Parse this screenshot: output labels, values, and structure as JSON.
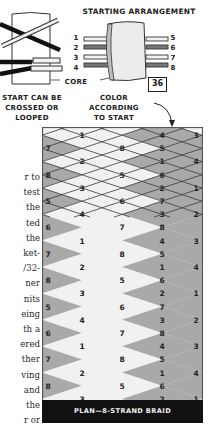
{
  "illustration": {
    "title": "STARTING ARRANGEMENT",
    "figure_number": "36",
    "strand_labels_left": [
      "1",
      "2",
      "3",
      "4"
    ],
    "strand_labels_right": [
      "5",
      "6",
      "7",
      "8"
    ],
    "core_label": "CORE",
    "left_caption": [
      "START CAN BE",
      "CROSSED OR",
      "LOOPED"
    ],
    "right_caption": [
      "COLOR",
      "ACCORDING",
      "TO START"
    ]
  },
  "body_text_fragments": [
    "r to",
    "test",
    "the",
    "ted",
    "the",
    "ket-",
    "/32-",
    "ner",
    "nits",
    "eing",
    "th a",
    "ered",
    "ther",
    "ving",
    "and",
    "the",
    "r or"
  ],
  "braid_plan": {
    "label": "PLAN—8-STRAND BRAID",
    "colors": {
      "light": "#f1f1f1",
      "dark": "#a9a9a9",
      "line": "#3a3a3a",
      "frame": "#555555"
    },
    "rows": [
      {
        "left": "",
        "a": "1",
        "b": "4",
        "right": "3"
      },
      {
        "left": "7",
        "a": "8",
        "b": "5",
        "right": ""
      },
      {
        "left": "",
        "a": "2",
        "b": "1",
        "right": "4"
      },
      {
        "left": "8",
        "a": "5",
        "b": "6",
        "right": ""
      },
      {
        "left": "",
        "a": "3",
        "b": "2",
        "right": "1"
      },
      {
        "left": "5",
        "a": "6",
        "b": "7",
        "right": ""
      },
      {
        "left": "",
        "a": "4",
        "b": "3",
        "right": "2"
      },
      {
        "left": "6",
        "a": "7",
        "b": "8",
        "right": ""
      },
      {
        "left": "",
        "a": "1",
        "b": "4",
        "right": "3"
      },
      {
        "left": "7",
        "a": "8",
        "b": "5",
        "right": ""
      },
      {
        "left": "",
        "a": "2",
        "b": "1",
        "right": "4"
      },
      {
        "left": "8",
        "a": "5",
        "b": "6",
        "right": ""
      },
      {
        "left": "",
        "a": "3",
        "b": "2",
        "right": "1"
      },
      {
        "left": "5",
        "a": "6",
        "b": "7",
        "right": ""
      },
      {
        "left": "",
        "a": "4",
        "b": "3",
        "right": "2"
      },
      {
        "left": "6",
        "a": "7",
        "b": "8",
        "right": ""
      },
      {
        "left": "",
        "a": "1",
        "b": "4",
        "right": "3"
      },
      {
        "left": "7",
        "a": "8",
        "b": "5",
        "right": ""
      },
      {
        "left": "",
        "a": "2",
        "b": "1",
        "right": "4"
      },
      {
        "left": "8",
        "a": "5",
        "b": "6",
        "right": ""
      },
      {
        "left": "",
        "a": "3",
        "b": "2",
        "right": "1"
      }
    ]
  }
}
